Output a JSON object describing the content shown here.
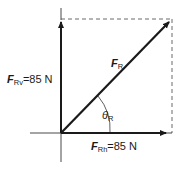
{
  "diagram": {
    "type": "vector-resolution",
    "resultant": {
      "symbol": "F",
      "subscript": "R"
    },
    "vertical_component": {
      "symbol": "F",
      "subscript": "Rv",
      "value": "=85 N"
    },
    "horizontal_component": {
      "symbol": "F",
      "subscript": "Rh",
      "value": "=85 N"
    },
    "angle": {
      "symbol": "θ",
      "subscript": "R"
    },
    "colors": {
      "lines": "#1a1a1a",
      "dashed": "#444444"
    }
  }
}
